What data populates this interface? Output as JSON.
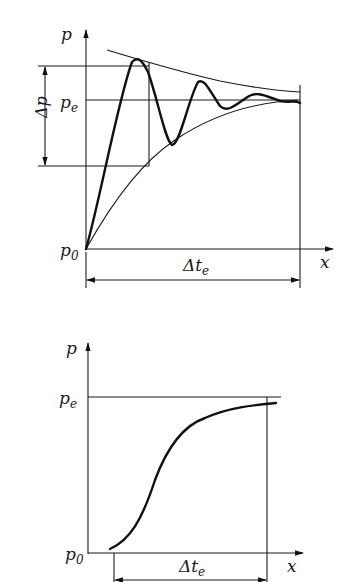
{
  "diagrams": [
    {
      "id": "top",
      "description": "Damped oscillating pressure rising from p0 to pe, with upper and lower envelopes",
      "labels": {
        "y_axis": "p",
        "x_axis": "x",
        "p_equilibrium": "p",
        "p_equilibrium_sub": "e",
        "p_origin": "p",
        "p_origin_sub": "0",
        "delta_p": "Δp",
        "delta_t": "Δt",
        "delta_t_sub": "e"
      }
    },
    {
      "id": "bottom",
      "description": "Monotonic S-shaped pressure rise from p0 approaching pe",
      "labels": {
        "y_axis": "p",
        "x_axis": "x",
        "p_equilibrium": "p",
        "p_equilibrium_sub": "e",
        "p_origin": "p",
        "p_origin_sub": "0",
        "delta_t": "Δt",
        "delta_t_sub": "e"
      }
    }
  ],
  "colors": {
    "ink": "#111111",
    "background": "#ffffff"
  }
}
